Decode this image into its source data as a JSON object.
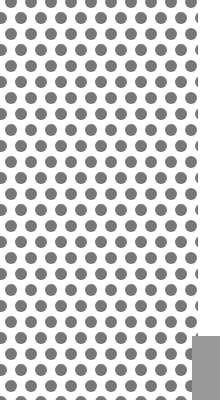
{
  "canvas": {
    "width": 220,
    "height": 400,
    "background": "#ffffff"
  },
  "dot_pattern": {
    "dot_color": "#777777",
    "dot_diameter": 12,
    "horizontal_spacing": 20,
    "row_spacing": 16,
    "alternate_row_offset": 10,
    "pattern_width": 198
  },
  "corner_block": {
    "color": "#999999",
    "x": 192,
    "y": 336,
    "width": 28,
    "height": 64
  }
}
